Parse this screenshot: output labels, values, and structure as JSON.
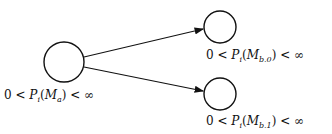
{
  "diagram": {
    "nodes": [
      {
        "id": "Ma",
        "cx": 64,
        "cy": 62,
        "r": 20,
        "label_pre": "0 < ",
        "P": "P",
        "P_sub": "i",
        "M": "M",
        "M_sub": "a",
        "label_post": " < ∞"
      },
      {
        "id": "Mb0",
        "cx": 220,
        "cy": 27,
        "r": 16,
        "label_pre": "0 < ",
        "P": "P",
        "P_sub": "i",
        "M": "M",
        "M_sub": "b.0",
        "label_post": " < ∞"
      },
      {
        "id": "Mb1",
        "cx": 220,
        "cy": 94,
        "r": 16,
        "label_pre": "0 < ",
        "P": "P",
        "P_sub": "i",
        "M": "M",
        "M_sub": "b.1",
        "label_post": " < ∞"
      }
    ],
    "edges": [
      {
        "from": "Ma",
        "to": "Mb0"
      },
      {
        "from": "Ma",
        "to": "Mb1"
      }
    ]
  }
}
